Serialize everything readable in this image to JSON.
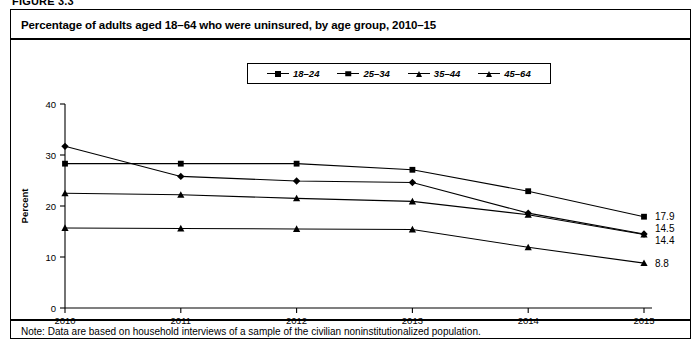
{
  "figure": {
    "number_label": "FIGURE 3.3",
    "title": "Percentage of adults aged 18–64 who were uninsured, by age group, 2010–15",
    "note": "Note: Data are based on household interviews of a sample of the civilian noninstitutionalized population."
  },
  "legend": {
    "entries": [
      {
        "label": "18–24",
        "marker": "diamond-marker-icon"
      },
      {
        "label": "25–34",
        "marker": "square-marker-icon"
      },
      {
        "label": "35–44",
        "marker": "triangle-marker-icon"
      },
      {
        "label": "45–64",
        "marker": "triangle-marker-icon"
      }
    ]
  },
  "axes": {
    "y_label": "Percent",
    "y_ticks": [
      "0",
      "10",
      "20",
      "30",
      "40"
    ],
    "x_ticks": [
      "2010",
      "2011",
      "2012",
      "2013",
      "2014",
      "2015"
    ]
  },
  "end_labels": [
    {
      "value": "17.9",
      "series": "25–34"
    },
    {
      "value": "14.5",
      "series": "18–24"
    },
    {
      "value": "14.4",
      "series": "35–44"
    },
    {
      "value": "8.8",
      "series": "45–64"
    }
  ],
  "chart_data": {
    "type": "line",
    "title": "Percentage of adults aged 18–64 who were uninsured, by age group, 2010–15",
    "xlabel": "",
    "ylabel": "Percent",
    "x": [
      "2010",
      "2011",
      "2012",
      "2013",
      "2014",
      "2015"
    ],
    "xlim": [
      2010,
      2015
    ],
    "ylim": [
      0,
      40
    ],
    "yticks": [
      0,
      10,
      20,
      30,
      40
    ],
    "grid": false,
    "legend_position": "top-center",
    "series": [
      {
        "name": "18–24",
        "marker": "diamond",
        "values": [
          31.7,
          25.8,
          24.9,
          24.6,
          18.6,
          14.5
        ],
        "end_label": "14.5"
      },
      {
        "name": "25–34",
        "marker": "square",
        "values": [
          28.3,
          28.3,
          28.3,
          27.1,
          22.9,
          17.9
        ],
        "end_label": "17.9"
      },
      {
        "name": "35–44",
        "marker": "triangle",
        "values": [
          22.5,
          22.2,
          21.5,
          20.9,
          18.3,
          14.4
        ],
        "end_label": "14.4"
      },
      {
        "name": "45–64",
        "marker": "triangle",
        "values": [
          15.7,
          15.6,
          15.5,
          15.4,
          11.9,
          8.8
        ],
        "end_label": "8.8"
      }
    ]
  }
}
